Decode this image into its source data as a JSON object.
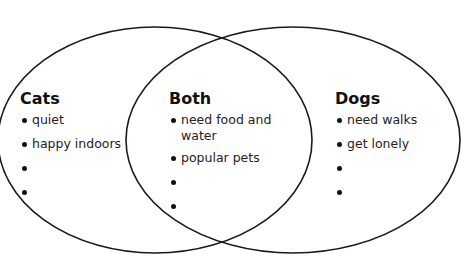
{
  "diagram": {
    "type": "venn",
    "stroke_color": "#1a1a1a",
    "circles": [
      {
        "name": "cats",
        "cx": 155,
        "cy": 140,
        "rx": 157,
        "ry": 113
      },
      {
        "name": "dogs",
        "cx": 293,
        "cy": 140,
        "rx": 167,
        "ry": 113
      }
    ],
    "regions": {
      "cats": {
        "title": "Cats",
        "items": [
          "quiet",
          "happy indoors",
          "",
          ""
        ]
      },
      "both": {
        "title": "Both",
        "items": [
          "need food and water",
          "popular pets",
          "",
          ""
        ]
      },
      "dogs": {
        "title": "Dogs",
        "items": [
          "need walks",
          "get lonely",
          "",
          ""
        ]
      }
    }
  }
}
